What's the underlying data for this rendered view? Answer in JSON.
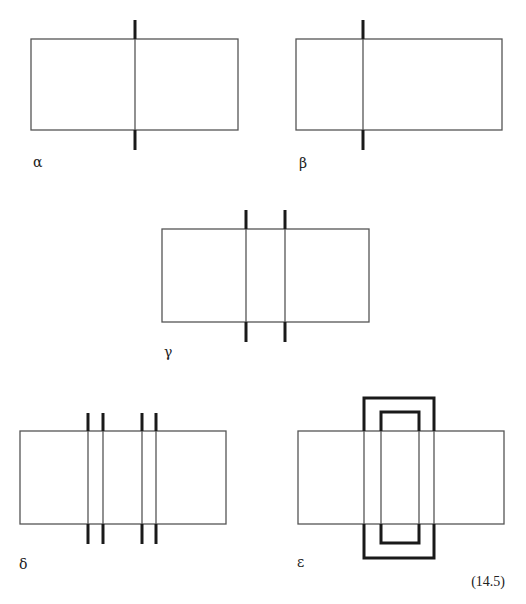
{
  "figure": {
    "equation_number": "(14.5)",
    "colors": {
      "stroke": "#555555",
      "thick": "#1a1a1a",
      "background": "#ffffff"
    },
    "panels": [
      {
        "id": "alpha",
        "label": "α",
        "rect": {
          "x": 31,
          "y": 39,
          "w": 207,
          "h": 91
        },
        "strands": [
          135
        ],
        "thick_ends": {
          "top": [
            20,
            39
          ],
          "bottom": [
            130,
            150
          ]
        },
        "label_pos": {
          "x": 33,
          "y": 167
        }
      },
      {
        "id": "beta",
        "label": "β",
        "rect": {
          "x": 296,
          "y": 39,
          "w": 206,
          "h": 91
        },
        "strands": [
          363
        ],
        "thick_ends": {
          "top": [
            20,
            39
          ],
          "bottom": [
            130,
            150
          ]
        },
        "label_pos": {
          "x": 299,
          "y": 168
        }
      },
      {
        "id": "gamma",
        "label": "γ",
        "rect": {
          "x": 162,
          "y": 229,
          "w": 207,
          "h": 93
        },
        "strands": [
          246,
          285
        ],
        "thick_ends": {
          "top": [
            210,
            229
          ],
          "bottom": [
            322,
            342
          ]
        },
        "label_pos": {
          "x": 164,
          "y": 357
        }
      },
      {
        "id": "delta",
        "label": "δ",
        "rect": {
          "x": 20,
          "y": 431,
          "w": 206,
          "h": 93
        },
        "strands": [
          88,
          103,
          142,
          156
        ],
        "thick_ends": {
          "top": [
            413,
            431
          ],
          "bottom": [
            524,
            544
          ]
        },
        "label_pos": {
          "x": 19,
          "y": 569
        }
      },
      {
        "id": "epsilon",
        "label": "ε",
        "rect": {
          "x": 298,
          "y": 431,
          "w": 206,
          "h": 93
        },
        "loops": [
          {
            "x1": 364,
            "x2": 434,
            "top": 398,
            "bottom": 558
          },
          {
            "x1": 381,
            "x2": 419,
            "top": 412,
            "bottom": 543
          }
        ],
        "label_pos": {
          "x": 297,
          "y": 567
        }
      }
    ]
  }
}
